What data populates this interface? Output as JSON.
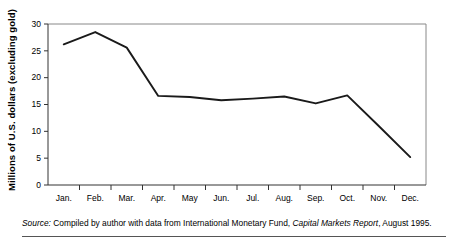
{
  "chart_data": {
    "type": "line",
    "title": "",
    "xlabel": "",
    "ylabel": "Millions of U.S. dollars (excluding gold)",
    "categories": [
      "Jan.",
      "Feb.",
      "Mar.",
      "Apr.",
      "May",
      "Jun.",
      "Jul.",
      "Aug.",
      "Sep.",
      "Oct.",
      "Nov.",
      "Dec."
    ],
    "values": [
      26.2,
      28.5,
      25.6,
      16.6,
      16.4,
      15.8,
      16.1,
      16.5,
      15.2,
      16.7,
      11.0,
      5.2
    ],
    "series": [
      {
        "name": "Reserves",
        "values": [
          26.2,
          28.5,
          25.6,
          16.6,
          16.4,
          15.8,
          16.1,
          16.5,
          15.2,
          16.7,
          11.0,
          5.2
        ]
      }
    ],
    "ylim": [
      0,
      30
    ],
    "yticks": [
      0,
      5,
      10,
      15,
      20,
      25,
      30
    ],
    "ytick_labels": [
      "0",
      "5",
      "10",
      "15",
      "20",
      "25",
      "30"
    ],
    "grid": false,
    "legend": "none",
    "line_color": "#1a1a1a",
    "axis_color": "#888888",
    "background": "#ffffff"
  },
  "source": {
    "lead": "Source:",
    "text_before": " Compiled by author with data from International Monetary Fund, ",
    "report_title": "Capital Markets Report",
    "text_after": ", August 1995."
  }
}
